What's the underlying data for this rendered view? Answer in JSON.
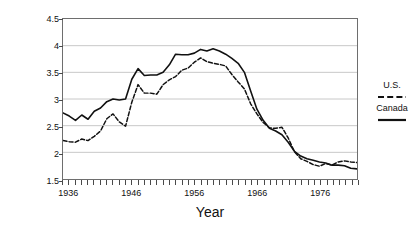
{
  "chart_data": {
    "type": "line",
    "title": "",
    "xlabel": "Year",
    "ylabel": "Live Births per Woman",
    "xlim": [
      1935,
      1982
    ],
    "ylim": [
      1.5,
      4.5
    ],
    "yticks": [
      1.5,
      2,
      2.5,
      3,
      3.5,
      4,
      4.5
    ],
    "ytick_labels": [
      "1.5",
      "2",
      "2.5",
      "3",
      "3.5",
      "4",
      "4.5"
    ],
    "xticks_major": [
      1936,
      1946,
      1956,
      1966,
      1976
    ],
    "xtick_labels": [
      "1936",
      "1946",
      "1956",
      "1966",
      "1976"
    ],
    "xtick_step": 1,
    "grid": "horizontal",
    "legend_position": "right",
    "x": [
      1935,
      1936,
      1937,
      1938,
      1939,
      1940,
      1941,
      1942,
      1943,
      1944,
      1945,
      1946,
      1947,
      1948,
      1949,
      1950,
      1951,
      1952,
      1953,
      1954,
      1955,
      1956,
      1957,
      1958,
      1959,
      1960,
      1961,
      1962,
      1963,
      1964,
      1965,
      1966,
      1967,
      1968,
      1969,
      1970,
      1971,
      1972,
      1973,
      1974,
      1975,
      1976,
      1977,
      1978,
      1979,
      1980,
      1981,
      1982
    ],
    "series": [
      {
        "name": "U.S.",
        "style": "dashed",
        "color": "#111111",
        "values": [
          2.22,
          2.2,
          2.19,
          2.25,
          2.22,
          2.3,
          2.4,
          2.63,
          2.72,
          2.57,
          2.49,
          2.94,
          3.27,
          3.11,
          3.11,
          3.09,
          3.27,
          3.36,
          3.42,
          3.54,
          3.58,
          3.69,
          3.77,
          3.7,
          3.67,
          3.65,
          3.62,
          3.46,
          3.32,
          3.19,
          2.91,
          2.72,
          2.56,
          2.46,
          2.45,
          2.47,
          2.27,
          2.01,
          1.88,
          1.83,
          1.77,
          1.74,
          1.79,
          1.76,
          1.82,
          1.84,
          1.82,
          1.81
        ],
        "peak_value": 3.77,
        "peak_year": 1957
      },
      {
        "name": "Canada",
        "style": "solid",
        "color": "#111111",
        "values": [
          2.74,
          2.68,
          2.6,
          2.7,
          2.62,
          2.77,
          2.83,
          2.95,
          3.0,
          2.98,
          3.0,
          3.37,
          3.57,
          3.44,
          3.45,
          3.45,
          3.5,
          3.64,
          3.84,
          3.83,
          3.83,
          3.86,
          3.93,
          3.9,
          3.94,
          3.9,
          3.84,
          3.76,
          3.67,
          3.5,
          3.15,
          2.81,
          2.6,
          2.45,
          2.4,
          2.33,
          2.19,
          2.02,
          1.93,
          1.88,
          1.85,
          1.82,
          1.8,
          1.76,
          1.76,
          1.75,
          1.7,
          1.69
        ],
        "peak_value": 3.94,
        "peak_year": 1959
      }
    ]
  },
  "legend": {
    "entries": [
      {
        "label": "U.S.",
        "style": "dashed"
      },
      {
        "label": "Canada",
        "style": "solid"
      }
    ]
  }
}
